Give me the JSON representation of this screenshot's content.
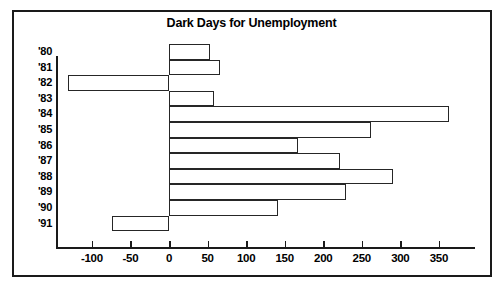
{
  "chart_data": {
    "type": "bar",
    "orientation": "horizontal",
    "title": "Dark Days for Unemployment",
    "xlabel": "",
    "ylabel": "",
    "categories": [
      "'80",
      "'81",
      "'82",
      "'83",
      "'84",
      "'85",
      "'86",
      "'87",
      "'88",
      "'89",
      "'90",
      "'91"
    ],
    "values": [
      53,
      66,
      -131,
      58,
      363,
      262,
      167,
      222,
      290,
      230,
      142,
      -74
    ],
    "series": [
      {
        "name": "Change",
        "values": [
          53,
          66,
          -131,
          58,
          363,
          262,
          167,
          222,
          290,
          230,
          142,
          -74
        ]
      }
    ],
    "xlim": [
      -140,
      390
    ],
    "xticks": [
      -100,
      -50,
      0,
      50,
      100,
      150,
      200,
      250,
      300,
      350
    ],
    "xtick_labels": [
      "-100",
      "-50",
      "0",
      "50",
      "100",
      "150",
      "200",
      "250",
      "300",
      "350"
    ],
    "grid": false,
    "legend": false,
    "bar_style": {
      "fill": "#ffffff",
      "edge": "#262626"
    },
    "colors": {
      "background": "#ffffff",
      "foreground": "#000000",
      "frame": "#1a1a1a"
    }
  }
}
